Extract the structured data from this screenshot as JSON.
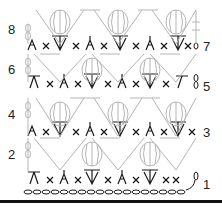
{
  "chart": {
    "row_labels": {
      "left": [
        {
          "label": "8",
          "x": 8,
          "y": 23
        },
        {
          "label": "6",
          "x": 8,
          "y": 63
        },
        {
          "label": "4",
          "x": 8,
          "y": 108
        },
        {
          "label": "2",
          "x": 8,
          "y": 148
        }
      ],
      "right": [
        {
          "label": "7",
          "x": 203,
          "y": 40
        },
        {
          "label": "5",
          "x": 203,
          "y": 80
        },
        {
          "label": "3",
          "x": 203,
          "y": 126
        },
        {
          "label": "1",
          "x": 203,
          "y": 178
        }
      ]
    },
    "colors": {
      "dark_stitch": "#1a1a1a",
      "light_stitch": "#b5b5b5",
      "rule": "#111111"
    }
  }
}
